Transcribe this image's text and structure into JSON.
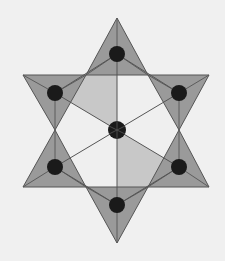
{
  "diagram": {
    "colors": {
      "background": "#f0f0f0",
      "triangle_fill": "#9a9a9a",
      "inner_light": "#c8c8c8",
      "inner_white": "#efefef",
      "edge": "#555555",
      "atom": "#1a1a1a"
    },
    "center_atom": {
      "x": 117,
      "y": 130,
      "r": 9
    },
    "triangles": [
      {
        "name": "top",
        "points": "117,18 86,75 148,75",
        "atom": {
          "x": 117,
          "y": 54
        }
      },
      {
        "name": "upper-left",
        "points": "23,75 86,75 55,130",
        "atom": {
          "x": 55,
          "y": 93
        }
      },
      {
        "name": "upper-right",
        "points": "148,75 209,75 179,130",
        "atom": {
          "x": 179,
          "y": 93
        }
      },
      {
        "name": "lower-left",
        "points": "55,130 86,187 23,187",
        "atom": {
          "x": 55,
          "y": 167
        }
      },
      {
        "name": "lower-right",
        "points": "179,130 209,187 148,187",
        "atom": {
          "x": 179,
          "y": 167
        }
      },
      {
        "name": "bottom",
        "points": "86,187 148,187 117,243",
        "atom": {
          "x": 117,
          "y": 205
        }
      }
    ],
    "atom_radius": 8
  }
}
